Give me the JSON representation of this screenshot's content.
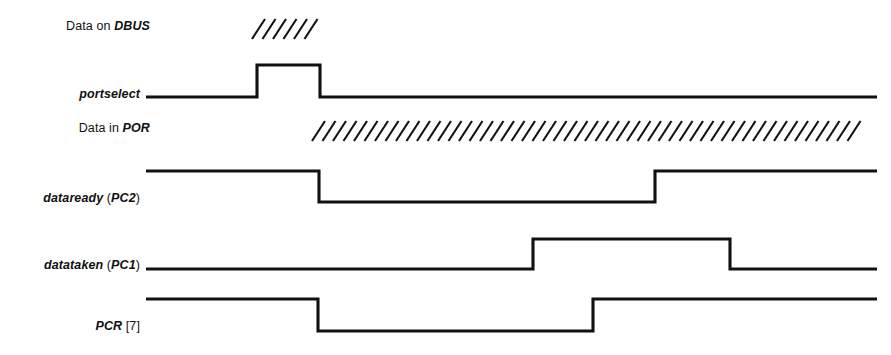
{
  "figure": {
    "type": "timing-diagram",
    "width": 891,
    "height": 355,
    "background": "#ffffff",
    "line_color": "#111111"
  },
  "signals": [
    {
      "id": "data-on-dbus",
      "label_parts": [
        {
          "text": "Data on ",
          "style": "plain"
        },
        {
          "text": "DBUS",
          "style": "em"
        }
      ],
      "label_text": "Data on DBUS",
      "label_x": 150,
      "label_y": 29,
      "render": "hatch",
      "hatch": {
        "x_start": 252,
        "x_end": 317,
        "y_top": 19,
        "y_bottom": 39,
        "spacing": 10.5,
        "slant": 13
      }
    },
    {
      "id": "portselect",
      "label_parts": [
        {
          "text": "portselect",
          "style": "em"
        }
      ],
      "label_text": "portselect",
      "label_x": 140,
      "label_y": 97,
      "render": "wave",
      "y_high": 65,
      "y_low": 97,
      "x_start": 146,
      "x_end": 877,
      "initial": "low",
      "edges": [
        {
          "x": 257,
          "to": "high"
        },
        {
          "x": 320,
          "to": "low"
        }
      ]
    },
    {
      "id": "data-in-por",
      "label_parts": [
        {
          "text": "Data in ",
          "style": "plain"
        },
        {
          "text": "POR",
          "style": "em"
        }
      ],
      "label_text": "Data in POR",
      "label_x": 150,
      "label_y": 131,
      "render": "hatch",
      "hatch": {
        "x_start": 312,
        "x_end": 866,
        "y_top": 121,
        "y_bottom": 141,
        "spacing": 10.5,
        "slant": 13
      }
    },
    {
      "id": "dataready-pc2",
      "label_parts": [
        {
          "text": "dataready",
          "style": "em"
        },
        {
          "text": " (",
          "style": "bracket"
        },
        {
          "text": "PC2",
          "style": "em"
        },
        {
          "text": ")",
          "style": "bracket"
        }
      ],
      "label_text": "dataready (PC2)",
      "label_x": 140,
      "label_y": 201,
      "render": "wave",
      "y_high": 171,
      "y_low": 202,
      "x_start": 146,
      "x_end": 877,
      "initial": "high",
      "edges": [
        {
          "x": 319,
          "to": "low"
        },
        {
          "x": 655,
          "to": "high"
        }
      ]
    },
    {
      "id": "datataken-pc1",
      "label_parts": [
        {
          "text": "datataken",
          "style": "em"
        },
        {
          "text": " (",
          "style": "bracket"
        },
        {
          "text": "PC1",
          "style": "em"
        },
        {
          "text": ")",
          "style": "bracket"
        }
      ],
      "label_text": "datataken (PC1)",
      "label_x": 140,
      "label_y": 268,
      "render": "wave",
      "y_high": 239,
      "y_low": 269,
      "x_start": 146,
      "x_end": 877,
      "initial": "low",
      "edges": [
        {
          "x": 533,
          "to": "high"
        },
        {
          "x": 730,
          "to": "low"
        }
      ]
    },
    {
      "id": "pcr-7",
      "label_parts": [
        {
          "text": "PCR",
          "style": "em"
        },
        {
          "text": " [7]",
          "style": "bracket"
        }
      ],
      "label_text": "PCR [7]",
      "label_x": 140,
      "label_y": 329,
      "render": "wave",
      "y_high": 299,
      "y_low": 331,
      "x_start": 146,
      "x_end": 877,
      "initial": "high",
      "edges": [
        {
          "x": 318,
          "to": "low"
        },
        {
          "x": 593,
          "to": "high"
        }
      ]
    }
  ]
}
